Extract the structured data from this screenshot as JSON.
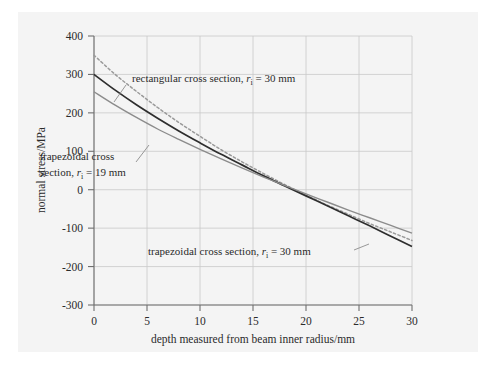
{
  "chart_data": {
    "type": "line",
    "title": "",
    "xlabel": "depth measured from beam inner radius/mm",
    "ylabel": "normal stress/MPa",
    "xlim": [
      0,
      30
    ],
    "ylim": [
      -300,
      400
    ],
    "xticks": [
      "0",
      "5",
      "10",
      "15",
      "20",
      "25",
      "30"
    ],
    "yticks": [
      "400",
      "300",
      "200",
      "100",
      "0",
      "-100",
      "-200",
      "-300"
    ],
    "grid": true,
    "legend_position": "inline-annotations",
    "x": [
      0,
      2,
      4,
      6,
      8,
      10,
      12,
      14,
      16,
      18,
      20,
      22,
      24,
      26,
      28,
      30
    ],
    "series": [
      {
        "name": "rectangular cross section, r_i = 30 mm",
        "style": "dotted",
        "color": "#9a9a9a",
        "values": [
          350,
          300,
          256,
          214,
          175,
          139,
          104,
          72,
          42,
          13,
          -14,
          -40,
          -64,
          -88,
          -110,
          -132
        ]
      },
      {
        "name": "trapezoidal cross section, r_i = 30 mm",
        "style": "solid",
        "color": "#2e2e2e",
        "values": [
          300,
          259,
          221,
          186,
          153,
          122,
          92,
          64,
          36,
          10,
          -16,
          -42,
          -68,
          -94,
          -121,
          -148
        ]
      },
      {
        "name": "trapezoidal cross section, r_i = 19 mm",
        "style": "solid",
        "color": "#8c8c8c",
        "values": [
          255,
          220,
          188,
          158,
          131,
          105,
          80,
          56,
          33,
          11,
          -11,
          -32,
          -53,
          -73,
          -93,
          -113
        ]
      }
    ],
    "annotations": [
      {
        "id": "annot-rectangular",
        "text_pre": "rectangular cross section, ",
        "text_var": "r",
        "text_sub": "i",
        "text_post": " = 30 mm"
      },
      {
        "id": "annot-trapezoidal-19",
        "line1": "trapezoidal cross",
        "text_pre": "section, ",
        "text_var": "r",
        "text_sub": "i",
        "text_post": " = 19 mm"
      },
      {
        "id": "annot-trapezoidal-30",
        "text_pre": "trapezoidal cross section, ",
        "text_var": "r",
        "text_sub": "i",
        "text_post": " = 30 mm"
      }
    ],
    "colors": {
      "panel_background": "#f4f4f4",
      "grid": "#c9c9c9",
      "axis": "#6f6f6f",
      "text": "#2b2b2b"
    }
  }
}
